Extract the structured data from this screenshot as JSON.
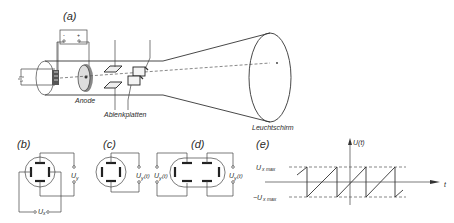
{
  "figure": {
    "panel_a": {
      "label": "(a)",
      "battery_minus": "-",
      "battery_plus": "+",
      "anode_label": "Anode",
      "deflection_plates_label": "Ablenkplatten",
      "screen_label": "Leuchtschirm"
    },
    "panel_b": {
      "label": "(b)",
      "voltage_y": "U",
      "voltage_y_sub": "y",
      "voltage_x": "U",
      "voltage_x_sub": "x"
    },
    "panel_c": {
      "label": "(c)",
      "voltage": "U",
      "voltage_sub": "y",
      "voltage_suffix": "(t)"
    },
    "panel_d": {
      "label": "(d)",
      "voltage": "U",
      "voltage_sub": "y",
      "voltage_suffix": "(t)"
    },
    "panel_e": {
      "label": "(e)",
      "y_axis_label": "U(t)",
      "x_axis_label": "t",
      "upper_level": "U",
      "upper_level_sub": "x max",
      "lower_level": "−U",
      "lower_level_sub": "x max",
      "waveform": "sawtooth"
    }
  }
}
